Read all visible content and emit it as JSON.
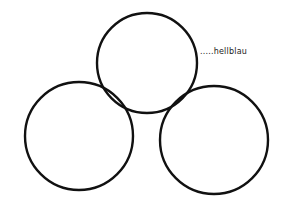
{
  "diagram": {
    "type": "three-circles",
    "stroke_color": "#111111",
    "background": "#ffffff",
    "circles": [
      {
        "id": "top",
        "cx": 147,
        "cy": 63,
        "r": 50
      },
      {
        "id": "left",
        "cx": 79,
        "cy": 136,
        "r": 54
      },
      {
        "id": "right",
        "cx": 214,
        "cy": 140,
        "r": 54
      }
    ],
    "annotation": {
      "text": ".....hellblau",
      "target": "top",
      "x": 200,
      "y": 48
    }
  }
}
